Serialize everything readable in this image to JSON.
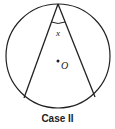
{
  "diagram": {
    "caption": "Case II",
    "angle_label": "x",
    "center_label": "O",
    "circle": {
      "cx": 58,
      "cy": 56,
      "r": 52
    },
    "vertex": {
      "x": 58,
      "y": 4
    },
    "chord_endpoints": [
      {
        "x": 24,
        "y": 98
      },
      {
        "x": 95,
        "y": 97
      }
    ],
    "center_dot": {
      "x": 58,
      "y": 61
    }
  }
}
